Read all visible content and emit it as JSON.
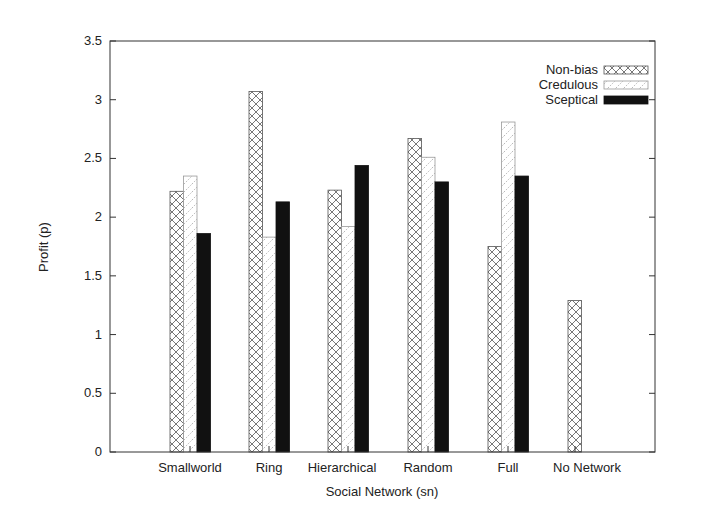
{
  "chart_data": {
    "type": "bar",
    "title": "",
    "xlabel": "Social Network (sn)",
    "ylabel": "Profit (p)",
    "ylim": [
      0,
      3.5
    ],
    "yticks": [
      0,
      0.5,
      1,
      1.5,
      2,
      2.5,
      3,
      3.5
    ],
    "ytick_labels": [
      "0",
      "0.5",
      "1",
      "1.5",
      "2",
      "2.5",
      "3",
      "3.5"
    ],
    "grid": false,
    "legend_position": "top-right",
    "categories": [
      "Smallworld",
      "Ring",
      "Hierarchical",
      "Random",
      "Full",
      "No Network"
    ],
    "series": [
      {
        "name": "Non-bias",
        "pattern": "crosshatch",
        "values": [
          2.22,
          3.07,
          2.23,
          2.67,
          1.75,
          1.29
        ]
      },
      {
        "name": "Credulous",
        "pattern": "dotted-diagonal",
        "values": [
          2.35,
          1.83,
          1.92,
          2.51,
          2.81,
          null
        ]
      },
      {
        "name": "Sceptical",
        "pattern": "solid-black",
        "values": [
          1.86,
          2.13,
          2.44,
          2.3,
          2.35,
          null
        ]
      }
    ]
  }
}
